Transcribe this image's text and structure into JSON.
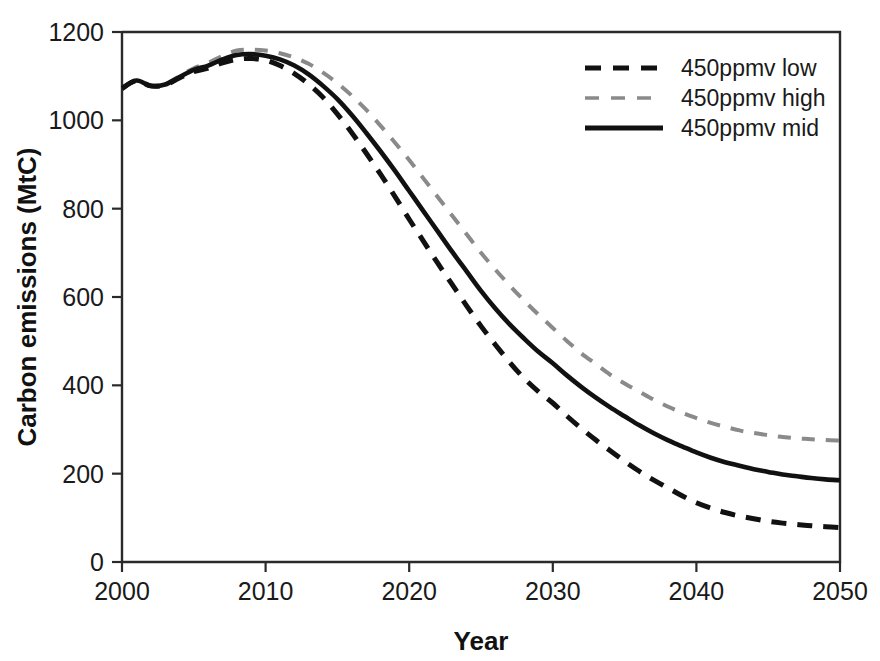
{
  "chart_data": {
    "type": "line",
    "title": "",
    "xlabel": "Year",
    "ylabel": "Carbon emissions (MtC)",
    "xlim": [
      2000,
      2050
    ],
    "ylim": [
      0,
      1200
    ],
    "xticks": [
      2000,
      2010,
      2020,
      2030,
      2040,
      2050
    ],
    "xtick_labels": [
      "2000",
      "2010",
      "2020",
      "2030",
      "2040",
      "2050"
    ],
    "yticks": [
      0,
      200,
      400,
      600,
      800,
      1000,
      1200
    ],
    "ytick_labels": [
      "0",
      "200",
      "400",
      "600",
      "800",
      "1000",
      "1200"
    ],
    "grid": false,
    "legend_position": "top-right",
    "x": [
      2000,
      2001,
      2002,
      2003,
      2004,
      2005,
      2006,
      2007,
      2008,
      2009,
      2010,
      2011,
      2012,
      2013,
      2014,
      2015,
      2016,
      2017,
      2018,
      2019,
      2020,
      2021,
      2022,
      2023,
      2024,
      2025,
      2026,
      2027,
      2028,
      2029,
      2030,
      2031,
      2032,
      2033,
      2034,
      2035,
      2036,
      2037,
      2038,
      2039,
      2040,
      2041,
      2042,
      2043,
      2044,
      2045,
      2046,
      2047,
      2048,
      2049,
      2050
    ],
    "series": [
      {
        "name": "450ppmv low",
        "style": "dashed",
        "color": "#111111",
        "width": 5,
        "values": [
          1072,
          1090,
          1078,
          1080,
          1096,
          1110,
          1118,
          1130,
          1138,
          1140,
          1136,
          1124,
          1106,
          1082,
          1052,
          1014,
          972,
          926,
          878,
          828,
          776,
          726,
          676,
          628,
          580,
          534,
          492,
          452,
          416,
          386,
          360,
          330,
          302,
          276,
          252,
          228,
          206,
          186,
          168,
          150,
          134,
          122,
          112,
          104,
          98,
          92,
          88,
          85,
          82,
          80,
          78
        ]
      },
      {
        "name": "450ppmv high",
        "style": "dashed",
        "color": "#8a8a8a",
        "width": 4,
        "values": [
          1072,
          1090,
          1078,
          1082,
          1100,
          1118,
          1130,
          1146,
          1158,
          1160,
          1158,
          1152,
          1142,
          1128,
          1108,
          1084,
          1056,
          1024,
          988,
          950,
          910,
          868,
          826,
          784,
          742,
          700,
          662,
          626,
          592,
          560,
          530,
          500,
          472,
          448,
          424,
          404,
          386,
          368,
          352,
          338,
          326,
          315,
          306,
          298,
          292,
          287,
          283,
          280,
          278,
          276,
          275
        ]
      },
      {
        "name": "450ppmv mid",
        "style": "solid",
        "color": "#111111",
        "width": 4.6,
        "values": [
          1072,
          1090,
          1078,
          1081,
          1098,
          1114,
          1124,
          1138,
          1148,
          1150,
          1146,
          1138,
          1124,
          1104,
          1078,
          1048,
          1012,
          972,
          930,
          886,
          840,
          794,
          748,
          702,
          658,
          614,
          574,
          538,
          506,
          476,
          450,
          422,
          396,
          372,
          350,
          330,
          310,
          292,
          276,
          262,
          248,
          236,
          226,
          218,
          210,
          204,
          198,
          194,
          190,
          187,
          185
        ]
      }
    ]
  },
  "legend": {
    "entries": [
      {
        "label": "450ppmv low",
        "style": "dashed",
        "color": "#111111"
      },
      {
        "label": "450ppmv high",
        "style": "dashed",
        "color": "#8a8a8a"
      },
      {
        "label": "450ppmv mid",
        "style": "solid",
        "color": "#111111"
      }
    ]
  },
  "axes": {
    "x_title": "Year",
    "y_title": "Carbon emissions (MtC)"
  }
}
